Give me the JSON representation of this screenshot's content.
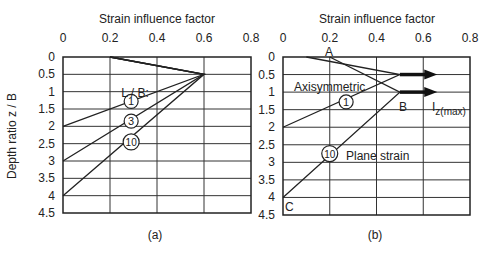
{
  "chart_data": [
    {
      "id": "a",
      "type": "line",
      "caption": "(a)",
      "title": "Strain influence factor",
      "xlabel": "Strain influence factor",
      "ylabel": "Depth ratio z / B",
      "xlim": [
        0,
        0.8
      ],
      "ylim": [
        0,
        4.5
      ],
      "y_inverted": true,
      "grid": true,
      "x_ticks": [
        0,
        0.2,
        0.4,
        0.6,
        0.8
      ],
      "x_tick_labels": [
        "0",
        "0.2",
        "0.4",
        "0.6",
        "0.8"
      ],
      "y_ticks": [
        0,
        0.5,
        1,
        1.5,
        2,
        2.5,
        3,
        3.5,
        4,
        4.5
      ],
      "y_tick_labels": [
        "0",
        "0.5",
        "1",
        "1.5",
        "2",
        "2.5",
        "3",
        "3.5",
        "4",
        "4.5"
      ],
      "legend_title": "L / B:",
      "series": [
        {
          "name": "1",
          "points": [
            [
              0.2,
              0
            ],
            [
              0.6,
              0.5
            ],
            [
              0,
              2
            ]
          ],
          "label_at": [
            0.29,
            1.28
          ]
        },
        {
          "name": "3",
          "points": [
            [
              0.2,
              0
            ],
            [
              0.6,
              0.5
            ],
            [
              0,
              3
            ]
          ],
          "label_at": [
            0.29,
            1.85
          ]
        },
        {
          "name": "10",
          "points": [
            [
              0.2,
              0
            ],
            [
              0.6,
              0.5
            ],
            [
              0,
              4
            ]
          ],
          "label_at": [
            0.29,
            2.45
          ]
        }
      ],
      "annotations": [
        {
          "text": "L / B:",
          "x": 0.3,
          "y": 0.95
        }
      ]
    },
    {
      "id": "b",
      "type": "line",
      "caption": "(b)",
      "title": "Strain influence factor",
      "xlabel": "Strain influence factor",
      "ylabel": "",
      "xlim": [
        0,
        0.8
      ],
      "ylim": [
        0,
        4.5
      ],
      "y_inverted": true,
      "grid": true,
      "x_ticks": [
        0,
        0.2,
        0.4,
        0.6,
        0.8
      ],
      "x_tick_labels": [
        "0",
        "0.2",
        "0.4",
        "0.6",
        "0.8"
      ],
      "y_ticks": [
        0,
        0.5,
        1,
        1.5,
        2,
        2.5,
        3,
        3.5,
        4,
        4.5
      ],
      "y_tick_labels": [
        "0",
        "0.5",
        "1",
        "1.5",
        "2",
        "2.5",
        "3",
        "3.5",
        "4",
        "4.5"
      ],
      "series": [
        {
          "name": "Axisymmetric",
          "circle_label": "1",
          "points": [
            [
              0.1,
              0
            ],
            [
              0.5,
              0.5
            ],
            [
              0,
              2
            ]
          ],
          "label_at": [
            0.27,
            1.28
          ]
        },
        {
          "name": "Plane strain",
          "circle_label": "10",
          "points": [
            [
              0.2,
              0
            ],
            [
              0.5,
              1
            ],
            [
              0,
              4
            ]
          ],
          "label_at": [
            0.2,
            2.75
          ]
        }
      ],
      "arrows": [
        {
          "from": [
            0.5,
            0.5
          ],
          "to": [
            0.66,
            0.5
          ]
        },
        {
          "from": [
            0.5,
            1
          ],
          "to": [
            0.66,
            1
          ]
        }
      ],
      "annotations": [
        {
          "text": "A",
          "x": 0.195,
          "y": -0.05
        },
        {
          "text": "B",
          "x": 0.5,
          "y": 1.42
        },
        {
          "text": "Axisymmetric",
          "x": 0.06,
          "y": 0.82
        },
        {
          "text": "Plane strain",
          "x": 0.27,
          "y": 2.85
        },
        {
          "text": "C",
          "x": 0.015,
          "y": 4.35
        },
        {
          "text": "I",
          "sub": "z(max)",
          "x": 0.64,
          "y": 1.42
        }
      ]
    }
  ],
  "panels": {
    "a": {
      "title": "Strain influence factor",
      "caption": "(a)",
      "ylabel": "Depth ratio z / B",
      "legend_title": "L / B:"
    },
    "b": {
      "title": "Strain influence factor",
      "caption": "(b)",
      "label_axisym": "Axisymmetric",
      "label_plane": "Plane strain",
      "point_a": "A",
      "point_b": "B",
      "point_c": "C",
      "izmax_main": "I",
      "izmax_sub": "z(max)"
    }
  }
}
